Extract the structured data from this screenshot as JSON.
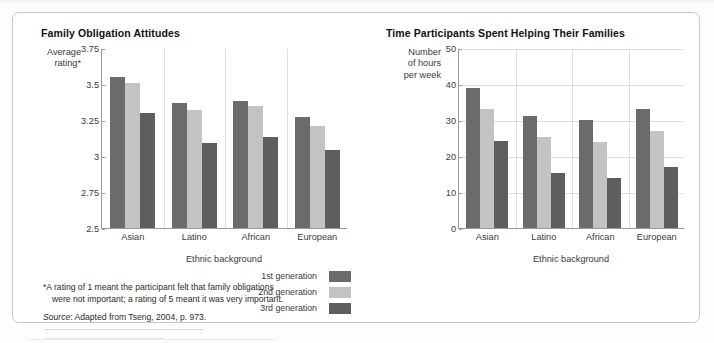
{
  "colors": {
    "gen1": "#6b6b6b",
    "gen2": "#c3c3c3",
    "gen3": "#5e5e5e",
    "grid": "#dedede",
    "axis": "#9a9a9a",
    "frame": "#c8c8c8",
    "text": "#2b2b2b"
  },
  "legend": {
    "items": [
      {
        "label": "1st generation",
        "color_key": "gen1"
      },
      {
        "label": "2nd generation",
        "color_key": "gen2"
      },
      {
        "label": "3rd generation",
        "color_key": "gen3"
      }
    ]
  },
  "footnote": {
    "line1": "*A rating of 1 meant the participant felt that family obligations",
    "line2": "were not important; a rating of 5 meant it was very important.",
    "source_prefix": "Source",
    "source_text": ": Adapted from Tseng, 2004, p. 973."
  },
  "chart_data": [
    {
      "type": "bar",
      "id": "family-obligation-attitudes",
      "title": "Family Obligation Attitudes",
      "ylabel": "Average rating*",
      "ylabel_lines": [
        "Average",
        "rating*"
      ],
      "xlabel": "Ethnic background",
      "categories": [
        "Asian",
        "Latino",
        "African",
        "European"
      ],
      "ylim": [
        2.5,
        3.75
      ],
      "yticks": [
        3.75,
        3.5,
        3.25,
        3,
        2.75,
        2.5
      ],
      "ytick_labels": [
        "3.75",
        "3.5",
        "3.25",
        "3",
        "2.75",
        "2.5"
      ],
      "grid": "vertical-group-separators",
      "series": [
        {
          "name": "1st generation",
          "color_key": "gen1",
          "values": [
            3.55,
            3.37,
            3.38,
            3.27
          ]
        },
        {
          "name": "2nd generation",
          "color_key": "gen2",
          "values": [
            3.51,
            3.32,
            3.35,
            3.21
          ]
        },
        {
          "name": "3rd generation",
          "color_key": "gen3",
          "values": [
            3.3,
            3.09,
            3.13,
            3.04
          ]
        }
      ]
    },
    {
      "type": "bar",
      "id": "time-spent-helping-families",
      "title": "Time Participants Spent Helping Their Families",
      "ylabel": "Number of hours per week",
      "ylabel_lines": [
        "Number",
        "of hours",
        "per week"
      ],
      "xlabel": "Ethnic background",
      "categories": [
        "Asian",
        "Latino",
        "African",
        "European"
      ],
      "ylim": [
        0,
        50
      ],
      "yticks": [
        50,
        40,
        30,
        20,
        10,
        0
      ],
      "ytick_labels": [
        "50",
        "40",
        "30",
        "20",
        "10",
        "0"
      ],
      "grid": "horizontal-and-vertical",
      "series": [
        {
          "name": "1st generation",
          "color_key": "gen1",
          "values": [
            39,
            31,
            30,
            33
          ]
        },
        {
          "name": "2nd generation",
          "color_key": "gen2",
          "values": [
            33,
            25.3,
            24,
            27
          ]
        },
        {
          "name": "3rd generation",
          "color_key": "gen3",
          "values": [
            24.3,
            15.2,
            14,
            17
          ]
        }
      ]
    }
  ]
}
